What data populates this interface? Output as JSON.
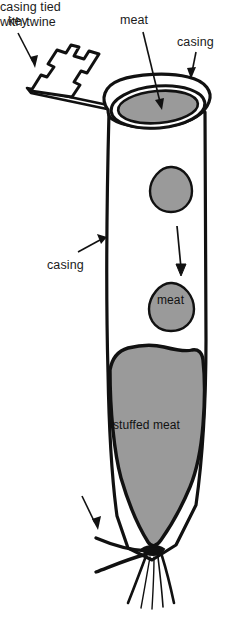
{
  "diagram": {
    "background_color": "#ffffff",
    "ink_color": "#111111",
    "meat_fill_color": "#9a9a9a",
    "labels": {
      "key": "key",
      "meat_top": "meat",
      "casing_top": "casing",
      "casing_middle": "casing",
      "meat_piece": "meat",
      "stuffed_meat": "stuffed meat",
      "casing_tied_line1": "casing tied",
      "casing_tied_line2": "with twine"
    },
    "parts": [
      {
        "id": "key",
        "label": "key",
        "description": "crenellated zigzag key with long flat shaft inserted under casing rim"
      },
      {
        "id": "casing-rim",
        "label": "casing",
        "description": "rolled casing collar at the top opening"
      },
      {
        "id": "casing-tube",
        "label": "casing",
        "description": "long vertical tube body"
      },
      {
        "id": "meat-opening",
        "label": "meat",
        "description": "gray meat visible through the oval top opening"
      },
      {
        "id": "meat-piece-upper",
        "label": "",
        "description": "gray teardrop piece of meat falling"
      },
      {
        "id": "meat-piece-lower",
        "label": "meat",
        "description": "gray teardrop piece of meat labelled meat"
      },
      {
        "id": "drop-arrow",
        "label": "",
        "description": "downward arrow showing meat falling"
      },
      {
        "id": "stuffed-meat",
        "label": "stuffed meat",
        "description": "large gray packed mass filling the lower casing"
      },
      {
        "id": "twine-tie",
        "label": "casing tied with twine",
        "description": "twine knot with trailing strands at the bottom"
      }
    ]
  }
}
